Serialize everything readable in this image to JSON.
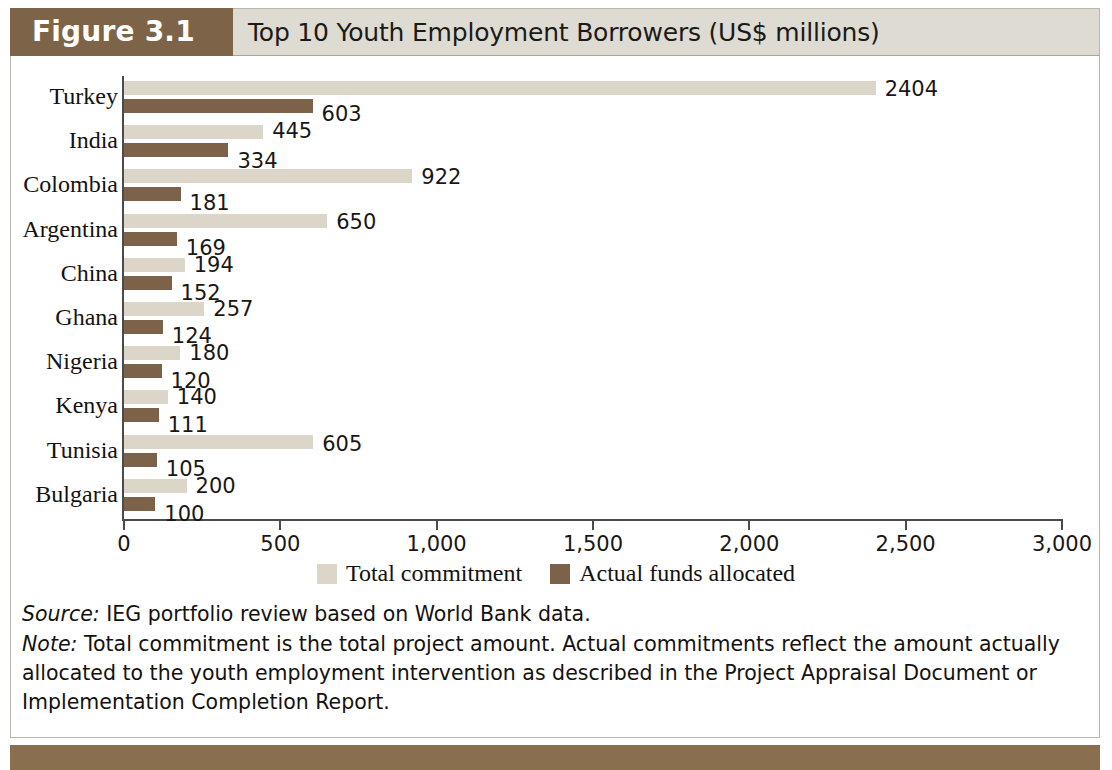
{
  "figure": {
    "tab_label": "Figure 3.1",
    "title": "Top 10 Youth Employment Borrowers (US$ millions)"
  },
  "colors": {
    "tab_background": "#7d6449",
    "header_background": "#dedbd2",
    "total_commitment": "#dcd6c8",
    "actual_allocated": "#7b6248",
    "footer_band": "#8a6f4e",
    "axis": "#4b4b4b",
    "text": "#14120f"
  },
  "legend": {
    "items": [
      {
        "label": "Total commitment",
        "color": "#dcd6c8"
      },
      {
        "label": "Actual funds allocated",
        "color": "#7b6248"
      }
    ]
  },
  "notes": {
    "source_lead": "Source:",
    "source_text": " IEG portfolio review based on World Bank data.",
    "note_lead": "Note:",
    "note_text": " Total commitment is the total project amount. Actual commitments reflect the amount actually allocated to the youth employment intervention as described in the Project Appraisal Document or Implementation Completion Report."
  },
  "chart_data": {
    "type": "bar",
    "orientation": "horizontal",
    "title": "Top 10 Youth Employment Borrowers (US$ millions)",
    "xlabel": "",
    "ylabel": "",
    "xlim": [
      0,
      3000
    ],
    "xticks": [
      0,
      500,
      1000,
      1500,
      2000,
      2500,
      3000
    ],
    "xtick_labels": [
      "0",
      "500",
      "1,000",
      "1,500",
      "2,000",
      "2,500",
      "3,000"
    ],
    "grid": false,
    "legend_position": "bottom",
    "categories": [
      "Turkey",
      "India",
      "Colombia",
      "Argentina",
      "China",
      "Ghana",
      "Nigeria",
      "Kenya",
      "Tunisia",
      "Bulgaria"
    ],
    "series": [
      {
        "name": "Total commitment",
        "color": "#dcd6c8",
        "values": [
          2404,
          445,
          922,
          650,
          194,
          257,
          180,
          140,
          605,
          200
        ],
        "labels": [
          "2404",
          "445",
          "922",
          "650",
          "194",
          "257",
          "180",
          "140",
          "605",
          "200"
        ]
      },
      {
        "name": "Actual funds allocated",
        "color": "#7b6248",
        "values": [
          603,
          334,
          181,
          169,
          152,
          124,
          120,
          111,
          105,
          100
        ],
        "labels": [
          "603",
          "334",
          "181",
          "169",
          "152",
          "124",
          "120",
          "111",
          "105",
          "100"
        ]
      }
    ]
  }
}
